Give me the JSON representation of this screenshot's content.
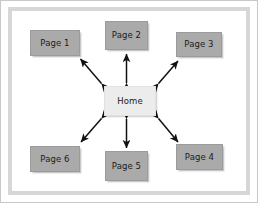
{
  "figure": {
    "background_color": "#ffffff",
    "frame_color": "#d7d7d7",
    "outer_border_color": "#c8c8c8"
  },
  "diagram": {
    "type": "hub-and-spoke",
    "hub": {
      "id": "home",
      "label": "Home",
      "fill_color": "#ececec",
      "x": 103,
      "y": 85,
      "width": 52,
      "height": 30
    },
    "spokes": [
      {
        "id": "page-1",
        "label": "Page 1",
        "fill_color": "#aaaaaa",
        "x": 29,
        "y": 29,
        "width": 50,
        "height": 26,
        "position": "top-left"
      },
      {
        "id": "page-2",
        "label": "Page 2",
        "fill_color": "#aaaaaa",
        "x": 104,
        "y": 20,
        "width": 43,
        "height": 29,
        "position": "top-center"
      },
      {
        "id": "page-3",
        "label": "Page 3",
        "fill_color": "#aaaaaa",
        "x": 175,
        "y": 31,
        "width": 46,
        "height": 25,
        "position": "top-right"
      },
      {
        "id": "page-4",
        "label": "Page 4",
        "fill_color": "#aaaaaa",
        "x": 175,
        "y": 143,
        "width": 47,
        "height": 26,
        "position": "bottom-right"
      },
      {
        "id": "page-5",
        "label": "Page 5",
        "fill_color": "#aaaaaa",
        "x": 104,
        "y": 150,
        "width": 43,
        "height": 30,
        "position": "bottom-center"
      },
      {
        "id": "page-6",
        "label": "Page 6",
        "fill_color": "#aaaaaa",
        "x": 29,
        "y": 145,
        "width": 50,
        "height": 26,
        "position": "bottom-left"
      }
    ],
    "connections": [
      {
        "id": "home-page-1",
        "from": "home",
        "to": "page-1",
        "style": "double-arrow",
        "orientation": "diagonal",
        "color": "#111111"
      },
      {
        "id": "home-page-2",
        "from": "home",
        "to": "page-2",
        "style": "double-arrow",
        "orientation": "vertical",
        "color": "#111111"
      },
      {
        "id": "home-page-3",
        "from": "home",
        "to": "page-3",
        "style": "double-arrow",
        "orientation": "diagonal",
        "color": "#111111"
      },
      {
        "id": "home-page-4",
        "from": "home",
        "to": "page-4",
        "style": "double-arrow",
        "orientation": "diagonal",
        "color": "#111111"
      },
      {
        "id": "home-page-5",
        "from": "home",
        "to": "page-5",
        "style": "double-arrow",
        "orientation": "vertical",
        "color": "#111111"
      },
      {
        "id": "home-page-6",
        "from": "home",
        "to": "page-6",
        "style": "double-arrow",
        "orientation": "diagonal",
        "color": "#111111"
      }
    ]
  }
}
